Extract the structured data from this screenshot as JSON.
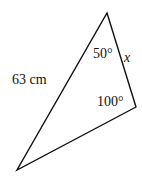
{
  "diagram": {
    "type": "triangle",
    "vertices": {
      "top": [
        107,
        13
      ],
      "right": [
        136,
        107
      ],
      "bottom_left": [
        17,
        170
      ]
    },
    "labels": {
      "side_left": "63 cm",
      "side_right": "x",
      "angle_top": "50°",
      "angle_right": "100°"
    },
    "stroke_color": "#111111"
  }
}
